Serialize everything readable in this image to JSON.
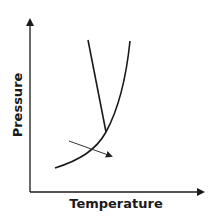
{
  "diagram": {
    "type": "phase-diagram",
    "xlabel": "Temperature",
    "ylabel": "Pressure",
    "colors": {
      "line": "#1a1a1a",
      "arrow": "#333333"
    },
    "curves": [
      {
        "name": "solid-gas-and-liquid-gas-boundary",
        "description": "Curved vaporization/sublimation line rising from lower-left to upper-right"
      },
      {
        "name": "solid-liquid-boundary",
        "description": "Steep line from top meeting the curve at the triple point"
      }
    ],
    "arrow": {
      "description": "Arrow crossing the lower curve left-to-right, pointing down-right"
    }
  }
}
